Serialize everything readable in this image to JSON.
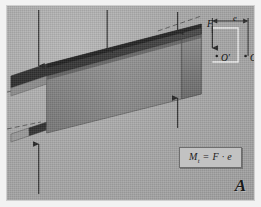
{
  "figure": {
    "label": "A",
    "background_color": "#a8a8a8",
    "beam_top_flange_color": "#3a3a3a",
    "beam_web_color": "#8a8a8a",
    "beam_edge_color": "#5a5a5a",
    "arrow_color": "#2b2b2b",
    "border_color": "#cfcfcf"
  },
  "formula": {
    "symbol": "M",
    "subscript": "t",
    "equals": "=",
    "expression": "F · e",
    "full_text": "Mₜ = F · e"
  },
  "inset": {
    "force_label": "F",
    "eccentricity_label": "e",
    "point_shifted_label": "O′",
    "point_center_label": "O",
    "bracket_color": "#efefef"
  },
  "load_arrows": [
    {
      "name": "arrow-top-left",
      "direction": "down",
      "x1": 32,
      "y1": 6,
      "x2": 32,
      "y2": 60
    },
    {
      "name": "arrow-top-mid",
      "direction": "down",
      "x1": 101,
      "y1": 5,
      "x2": 101,
      "y2": 48
    },
    {
      "name": "arrow-top-right",
      "direction": "down",
      "x1": 172,
      "y1": 7,
      "x2": 172,
      "y2": 30
    },
    {
      "name": "arrow-bottom-left",
      "direction": "up",
      "x1": 32,
      "y1": 190,
      "x2": 32,
      "y2": 140
    },
    {
      "name": "arrow-right-up",
      "direction": "up",
      "x1": 172,
      "y1": 120,
      "x2": 172,
      "y2": 96
    }
  ],
  "reference_lines": [
    {
      "name": "dashed-line-upper",
      "note": "construction line through top-right corner"
    },
    {
      "name": "dashed-line-lower",
      "note": "construction line through mid-right corner"
    },
    {
      "name": "dashed-line-left-upper",
      "note": "construction line at left flange"
    },
    {
      "name": "dashed-line-left-lower",
      "note": "construction line at left lower flange"
    }
  ]
}
